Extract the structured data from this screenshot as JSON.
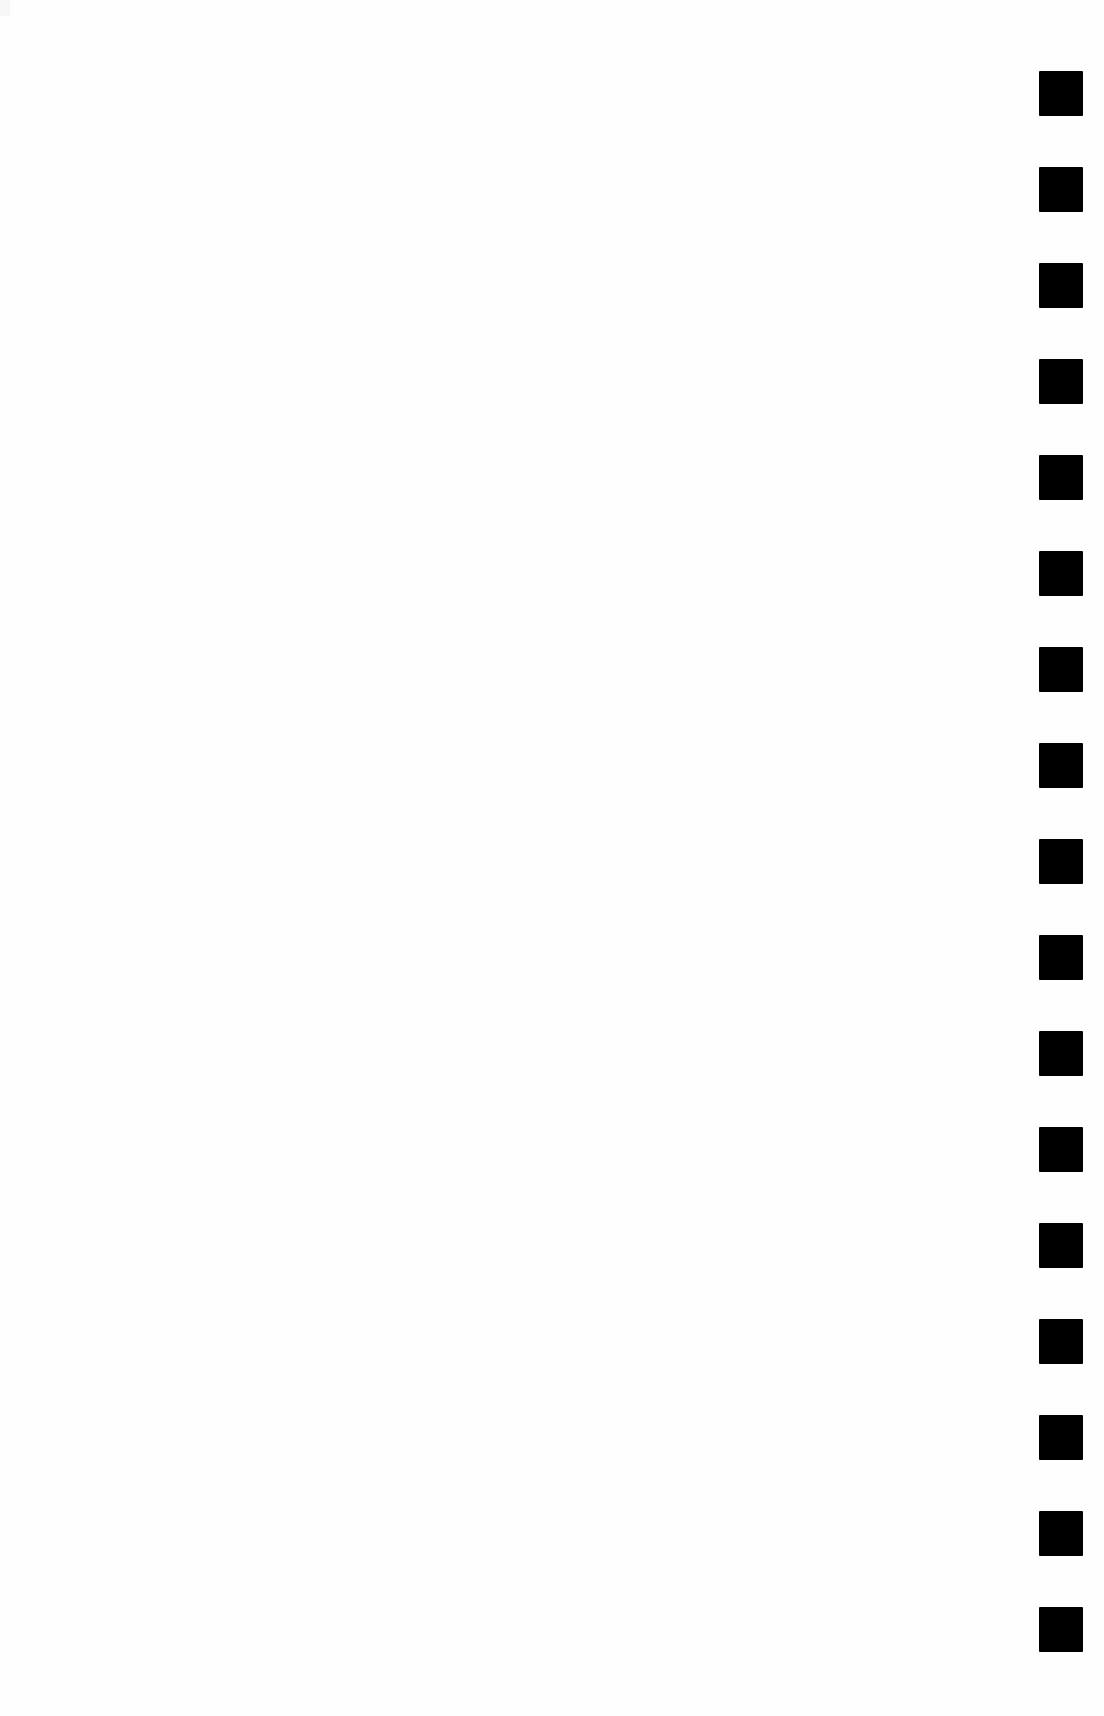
{
  "page": {
    "type": "scanned-blank-page",
    "background_color": "#ffffff",
    "text": ""
  },
  "markers": {
    "color": "#000000",
    "count": 17,
    "shape": "square",
    "size_px": 44,
    "pitch_px": 96,
    "first_top_px": 71,
    "left_px": 1039
  }
}
